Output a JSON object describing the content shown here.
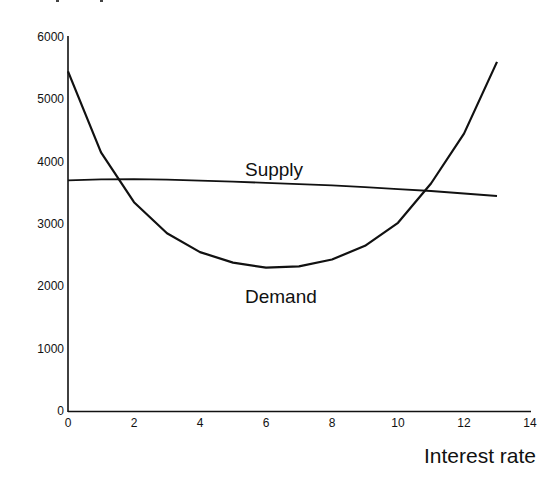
{
  "chart_data": {
    "type": "line",
    "title": "",
    "xlabel": "Interest rate",
    "ylabel": "",
    "xlim": [
      0,
      14
    ],
    "ylim": [
      0,
      6000
    ],
    "grid": false,
    "legend": "inline labels",
    "x_ticks": [
      "0",
      "2",
      "4",
      "6",
      "8",
      "10",
      "12",
      "14"
    ],
    "y_ticks": [
      "0",
      "1000",
      "2000",
      "3000",
      "4000",
      "5000",
      "6000"
    ],
    "x": [
      0,
      1,
      2,
      3,
      4,
      5,
      6,
      7,
      8,
      9,
      10,
      11,
      12,
      13
    ],
    "series": [
      {
        "name": "Supply",
        "values": [
          3700,
          3715,
          3720,
          3710,
          3695,
          3680,
          3660,
          3640,
          3620,
          3590,
          3560,
          3530,
          3490,
          3450
        ]
      },
      {
        "name": "Demand",
        "values": [
          5450,
          4150,
          3350,
          2850,
          2550,
          2380,
          2300,
          2320,
          2430,
          2650,
          3020,
          3650,
          4450,
          5600
        ]
      }
    ],
    "annotations": [
      {
        "text": "Supply",
        "x": 5.3,
        "y": 3900
      },
      {
        "text": "Demand",
        "x": 5.3,
        "y": 1750
      }
    ]
  }
}
